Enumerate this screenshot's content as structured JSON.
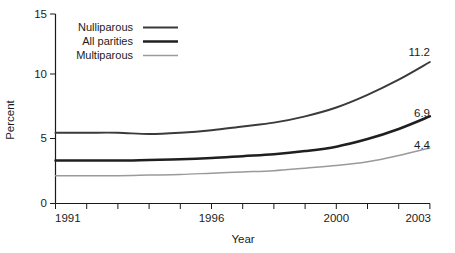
{
  "chart_data": {
    "type": "line",
    "title": "",
    "xlabel": "Year",
    "ylabel": "Percent",
    "x": [
      1991,
      1992,
      1993,
      1994,
      1995,
      1996,
      1997,
      1998,
      1999,
      2000,
      2001,
      2002,
      2003
    ],
    "xlim": [
      1991,
      2003
    ],
    "ylim": [
      0,
      15
    ],
    "yticks": [
      0,
      5,
      10,
      15
    ],
    "ytick_labels": [
      "0",
      "5",
      "10",
      "15"
    ],
    "xticks": [
      1991,
      1992,
      1993,
      1994,
      1995,
      1996,
      1997,
      1998,
      1999,
      2000,
      2001,
      2002,
      2003
    ],
    "xtick_labels_shown": [
      "1991",
      "1996",
      "2000",
      "2003"
    ],
    "grid": false,
    "legend_position": "top-left-inside",
    "series": [
      {
        "name": "Nulliparous",
        "color": "#3a3a3a",
        "width": 1.9,
        "values": [
          5.6,
          5.6,
          5.6,
          5.5,
          5.6,
          5.8,
          6.1,
          6.4,
          6.9,
          7.6,
          8.6,
          9.8,
          11.2
        ],
        "end_label": "11.2"
      },
      {
        "name": "All parities",
        "color": "#1f1f1f",
        "width": 2.5,
        "values": [
          3.4,
          3.4,
          3.4,
          3.45,
          3.5,
          3.6,
          3.75,
          3.9,
          4.15,
          4.5,
          5.1,
          5.9,
          6.9
        ],
        "end_label": "6.9"
      },
      {
        "name": "Multiparous",
        "color": "#9a9a9a",
        "width": 1.5,
        "values": [
          2.2,
          2.2,
          2.2,
          2.25,
          2.3,
          2.4,
          2.5,
          2.6,
          2.8,
          3.0,
          3.3,
          3.8,
          4.4
        ],
        "end_label": "4.4"
      }
    ]
  },
  "axes": {
    "y_title": "Percent",
    "x_title": "Year",
    "y_tick_0": "0",
    "y_tick_1": "5",
    "y_tick_2": "10",
    "y_tick_3": "15",
    "x_tick_1991": "1991",
    "x_tick_1996": "1996",
    "x_tick_2000": "2000",
    "x_tick_2003": "2003"
  },
  "legend": {
    "items": [
      {
        "label": "Nulliparous",
        "color": "#3a3a3a",
        "width": 1.9
      },
      {
        "label": "All parities",
        "color": "#1f1f1f",
        "width": 2.5
      },
      {
        "label": "Multiparous",
        "color": "#9a9a9a",
        "width": 1.5
      }
    ]
  },
  "end_labels": {
    "nulliparous": "11.2",
    "all_parities": "6.9",
    "multiparous": "4.4"
  }
}
